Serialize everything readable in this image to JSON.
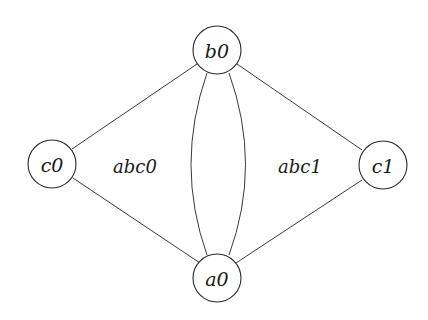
{
  "diagram": {
    "type": "graph",
    "background": "#ffffff",
    "stroke_color": "#2a2a2a",
    "nodes": [
      {
        "id": "b0",
        "label": "b0",
        "cx": 217,
        "cy": 50,
        "r": 24
      },
      {
        "id": "c0",
        "label": "c0",
        "cx": 52,
        "cy": 164,
        "r": 24
      },
      {
        "id": "c1",
        "label": "c1",
        "cx": 383,
        "cy": 165,
        "r": 24
      },
      {
        "id": "a0",
        "label": "a0",
        "cx": 217,
        "cy": 278,
        "r": 24
      }
    ],
    "edges": [
      {
        "from": "b0",
        "to": "c0",
        "shape": "straight"
      },
      {
        "from": "c0",
        "to": "a0",
        "shape": "straight"
      },
      {
        "from": "b0",
        "to": "c1",
        "shape": "straight"
      },
      {
        "from": "c1",
        "to": "a0",
        "shape": "straight"
      },
      {
        "from": "b0",
        "to": "a0",
        "shape": "curved-left"
      },
      {
        "from": "b0",
        "to": "a0",
        "shape": "curved-right"
      }
    ],
    "face_labels": [
      {
        "id": "abc0",
        "label": "abc0",
        "x": 135,
        "y": 165
      },
      {
        "id": "abc1",
        "label": "abc1",
        "x": 300,
        "y": 165
      }
    ]
  }
}
